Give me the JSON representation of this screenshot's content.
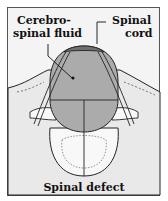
{
  "figure": {
    "caption": "Spinal defect",
    "labels": {
      "csf_line1": "Cerebro-",
      "csf_line2": "spinal fluid",
      "cord_line1": "Spinal",
      "cord_line2": "cord"
    },
    "colors": {
      "background": "#f4f4f4",
      "skin": "#e6e6e6",
      "sac": "#a9a9a9",
      "cord": "#6f6f6f",
      "vertebra": "#f8f8f8",
      "outline": "#222222"
    }
  }
}
